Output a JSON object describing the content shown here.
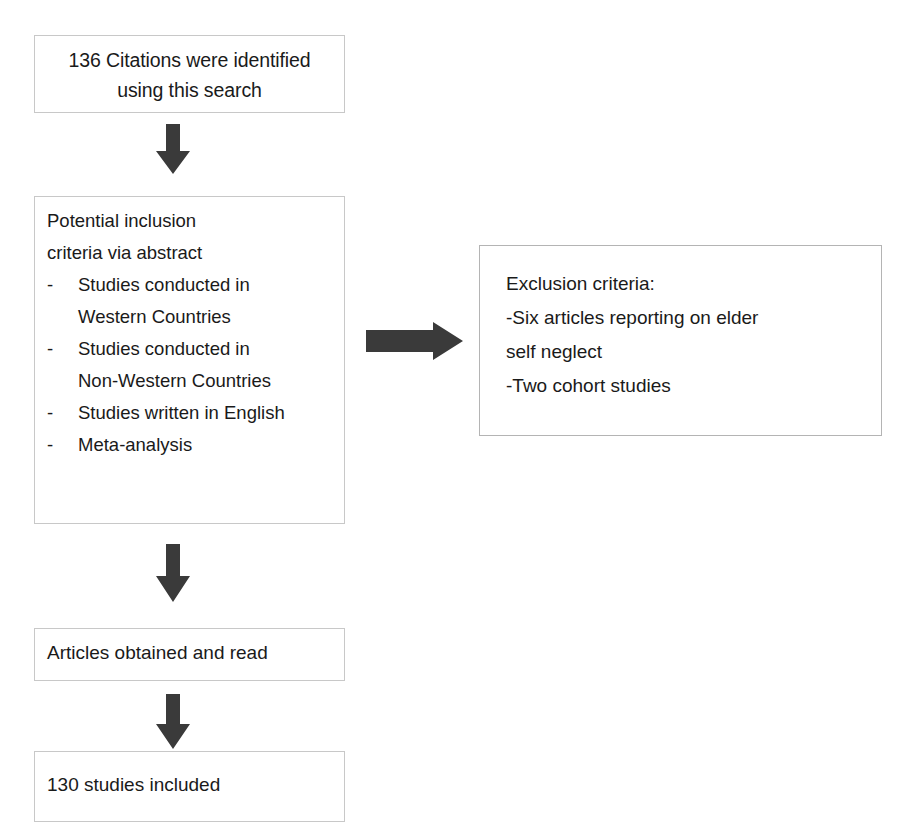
{
  "diagram": {
    "type": "flowchart",
    "colors": {
      "box_border": "#c8c8c8",
      "box_fill": "#ffffff",
      "arrow_fill": "#3a3a3a",
      "text": "#1a1a1a"
    }
  },
  "nodes": {
    "citations": {
      "id": "box-citations",
      "line1": "136 Citations were identified",
      "line2": "using this search",
      "count": "136"
    },
    "inclusion": {
      "id": "box-inclusion",
      "heading_line1": "Potential inclusion",
      "heading_line2": "criteria via abstract",
      "bullet_marker": "-",
      "criteria": [
        {
          "line1": "Studies conducted in",
          "line2": "Western Countries"
        },
        {
          "line1": "Studies conducted in",
          "line2": "Non-Western Countries"
        },
        {
          "line1": "Studies written in English",
          "line2": ""
        },
        {
          "line1": "Meta-analysis",
          "line2": ""
        }
      ]
    },
    "exclusion": {
      "id": "box-exclusion",
      "heading": "Exclusion criteria:",
      "line1": "-Six articles reporting on elder",
      "line2": "self neglect",
      "line3": "-Two cohort studies"
    },
    "articles": {
      "id": "box-articles",
      "label": "Articles obtained and read"
    },
    "included": {
      "id": "box-included",
      "label": "130 studies included",
      "count": "130"
    }
  },
  "arrows": {
    "citations_to_inclusion": {
      "name": "down-arrow-icon",
      "direction": "down"
    },
    "inclusion_to_exclusion": {
      "name": "right-arrow-icon",
      "direction": "right"
    },
    "inclusion_to_articles": {
      "name": "down-arrow-icon",
      "direction": "down"
    },
    "articles_to_included": {
      "name": "down-arrow-icon",
      "direction": "down"
    }
  }
}
